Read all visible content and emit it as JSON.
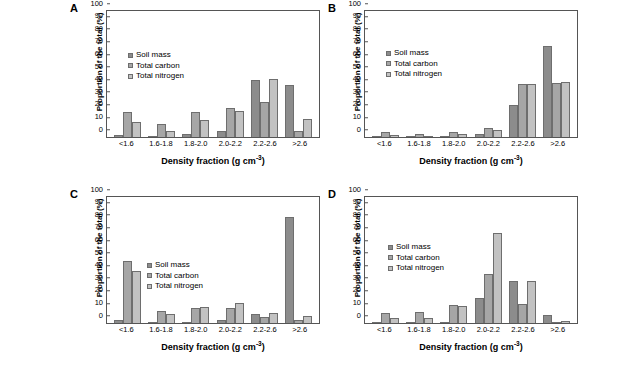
{
  "figure": {
    "name": "soil-density-fraction-figure",
    "background": "#ffffff",
    "series_colors": [
      "#8c8c8c",
      "#a6a6a6",
      "#c2c2c2"
    ]
  },
  "common": {
    "ylabel": "Proportion of the total (%)",
    "xlabel_text": "Density fraction (g cm",
    "xlabel_exp": "-3",
    "xlabel_close": ")",
    "categories": [
      "<1.6",
      "1.6-1.8",
      "1.8-2.0",
      "2.0-2.2",
      "2.2-2.6",
      ">2.6"
    ],
    "yticks": [
      "0",
      "10",
      "20",
      "30",
      "40",
      "50",
      "60",
      "70",
      "80",
      "90",
      "100"
    ],
    "ylim": [
      0,
      100
    ],
    "legend": [
      "Soil mass",
      "Total carbon",
      "Total nitrogen"
    ]
  },
  "chart_data": [
    {
      "type": "bar",
      "panel": "A",
      "title": "Chromosol",
      "xlabel": "Density fraction (g cm-3)",
      "ylabel": "Proportion of the total (%)",
      "ylim": [
        0,
        100
      ],
      "grid": false,
      "legend_position": "upper-left-inside",
      "categories": [
        "<1.6",
        "1.6-1.8",
        "1.8-2.0",
        "2.0-2.2",
        "2.2-2.6",
        ">2.6"
      ],
      "series": [
        {
          "name": "Soil mass",
          "values": [
            1.3,
            0.6,
            2.0,
            4.8,
            45.0,
            41.5
          ]
        },
        {
          "name": "Total carbon",
          "values": [
            20.0,
            10.5,
            19.8,
            22.8,
            28.0,
            4.5
          ]
        },
        {
          "name": "Total nitrogen",
          "values": [
            12.0,
            4.6,
            13.4,
            21.0,
            46.0,
            14.0
          ]
        }
      ]
    },
    {
      "type": "bar",
      "panel": "B",
      "title": "Ferrosol",
      "xlabel": "Density fraction (g cm-3)",
      "ylabel": "Proportion of the total (%)",
      "ylim": [
        0,
        100
      ],
      "grid": false,
      "legend_position": "upper-left-inside",
      "categories": [
        "<1.6",
        "1.6-1.8",
        "1.8-2.0",
        "2.0-2.2",
        "2.2-2.6",
        ">2.6"
      ],
      "series": [
        {
          "name": "Soil mass",
          "values": [
            0.3,
            0.2,
            1.0,
            2.0,
            25.8,
            72.5
          ]
        },
        {
          "name": "Total carbon",
          "values": [
            4.0,
            2.0,
            3.6,
            7.0,
            42.2,
            43.2
          ]
        },
        {
          "name": "Total nitrogen",
          "values": [
            1.8,
            1.0,
            2.5,
            5.3,
            42.2,
            43.8
          ]
        }
      ]
    },
    {
      "type": "bar",
      "panel": "C",
      "title": "Sodosol",
      "xlabel": "Density fraction (g cm-3)",
      "ylabel": "Proportion of the total (%)",
      "ylim": [
        0,
        100
      ],
      "grid": false,
      "legend_position": "center-left-inside",
      "categories": [
        "<1.6",
        "1.6-1.8",
        "1.8-2.0",
        "2.0-2.2",
        "2.2-2.6",
        ">2.6"
      ],
      "series": [
        {
          "name": "Soil mass",
          "values": [
            2.5,
            0.8,
            1.2,
            2.0,
            7.0,
            84.0
          ]
        },
        {
          "name": "Total carbon",
          "values": [
            49.5,
            9.3,
            12.0,
            12.0,
            4.8,
            2.2
          ]
        },
        {
          "name": "Total nitrogen",
          "values": [
            41.0,
            7.0,
            12.5,
            15.7,
            8.0,
            5.5
          ]
        }
      ]
    },
    {
      "type": "bar",
      "panel": "D",
      "title": "Vertosol",
      "xlabel": "Density fraction (g cm-3)",
      "ylabel": "Proportion of the total (%)",
      "ylim": [
        0,
        100
      ],
      "grid": false,
      "legend_position": "upper-left-inside",
      "categories": [
        "<1.6",
        "1.6-1.8",
        "1.8-2.0",
        "2.0-2.2",
        "2.2-2.6",
        ">2.6"
      ],
      "series": [
        {
          "name": "Soil mass",
          "values": [
            0.5,
            0.6,
            1.2,
            19.7,
            33.2,
            6.0
          ]
        },
        {
          "name": "Total carbon",
          "values": [
            7.8,
            8.6,
            14.2,
            38.8,
            15.0,
            0.8
          ]
        },
        {
          "name": "Total nitrogen",
          "values": [
            3.7,
            3.8,
            13.8,
            71.2,
            33.2,
            1.4
          ]
        }
      ]
    }
  ]
}
